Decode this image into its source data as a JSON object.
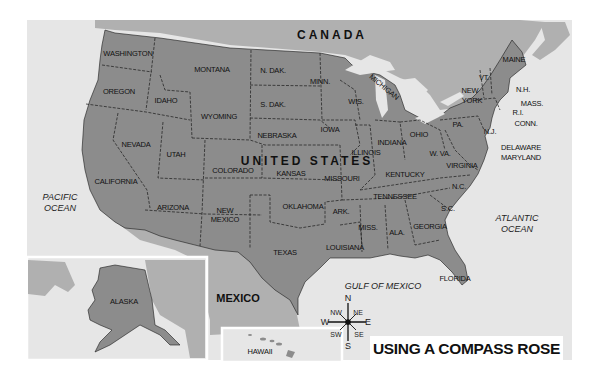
{
  "title": "USING A COMPASS ROSE",
  "countries": [
    {
      "name": "CANADA",
      "x": 332,
      "y": 35,
      "size": 12,
      "spacing": 3
    },
    {
      "name": "UNITED STATES",
      "x": 307,
      "y": 161,
      "size": 12,
      "spacing": 3
    },
    {
      "name": "MEXICO",
      "x": 238,
      "y": 298,
      "size": 11,
      "spacing": 0
    }
  ],
  "oceans": [
    {
      "name": "PACIFIC",
      "name2": "OCEAN",
      "x": 60,
      "y": 203
    },
    {
      "name": "ATLANTIC",
      "name2": "OCEAN",
      "x": 517,
      "y": 224
    },
    {
      "name": "GULF OF MEXICO",
      "name2": "",
      "x": 383,
      "y": 286
    }
  ],
  "states": [
    {
      "name": "WASHINGTON",
      "x": 128,
      "y": 53
    },
    {
      "name": "OREGON",
      "x": 119,
      "y": 91
    },
    {
      "name": "IDAHO",
      "x": 166,
      "y": 100
    },
    {
      "name": "MONTANA",
      "x": 212,
      "y": 69
    },
    {
      "name": "WYOMING",
      "x": 219,
      "y": 116
    },
    {
      "name": "N. DAK.",
      "x": 273,
      "y": 70
    },
    {
      "name": "S. DAK.",
      "x": 273,
      "y": 104
    },
    {
      "name": "NEBRASKA",
      "x": 277,
      "y": 135
    },
    {
      "name": "NEVADA",
      "x": 136,
      "y": 144
    },
    {
      "name": "UTAH",
      "x": 176,
      "y": 154
    },
    {
      "name": "COLORADO",
      "x": 233,
      "y": 170
    },
    {
      "name": "KANSAS",
      "x": 291,
      "y": 173
    },
    {
      "name": "CALIFORNIA",
      "x": 116,
      "y": 181
    },
    {
      "name": "ARIZONA",
      "x": 173,
      "y": 207
    },
    {
      "name": "NEW",
      "x": 225,
      "y": 210
    },
    {
      "name": "MEXICO",
      "x": 225,
      "y": 219
    },
    {
      "name": "OKLAHOMA",
      "x": 303,
      "y": 206
    },
    {
      "name": "TEXAS",
      "x": 285,
      "y": 252
    },
    {
      "name": "MINN.",
      "x": 320,
      "y": 81
    },
    {
      "name": "WIS.",
      "x": 356,
      "y": 101
    },
    {
      "name": "MICHIGAN",
      "x": 384,
      "y": 87,
      "rotate": 40
    },
    {
      "name": "IOWA",
      "x": 330,
      "y": 129
    },
    {
      "name": "ILLINOIS",
      "x": 366,
      "y": 152
    },
    {
      "name": "INDIANA",
      "x": 392,
      "y": 142
    },
    {
      "name": "OHIO",
      "x": 419,
      "y": 134
    },
    {
      "name": "MISSOURI",
      "x": 342,
      "y": 178
    },
    {
      "name": "KENTUCKY",
      "x": 405,
      "y": 174
    },
    {
      "name": "W. VA.",
      "x": 440,
      "y": 153
    },
    {
      "name": "VIRGINIA",
      "x": 462,
      "y": 165
    },
    {
      "name": "TENNESSEE",
      "x": 395,
      "y": 196
    },
    {
      "name": "N.C.",
      "x": 459,
      "y": 186
    },
    {
      "name": "S.C.",
      "x": 448,
      "y": 208
    },
    {
      "name": "ARK.",
      "x": 341,
      "y": 211
    },
    {
      "name": "MISS.",
      "x": 368,
      "y": 227
    },
    {
      "name": "ALA.",
      "x": 397,
      "y": 232
    },
    {
      "name": "GEORGIA",
      "x": 430,
      "y": 226
    },
    {
      "name": "LOUISIANA",
      "x": 345,
      "y": 247
    },
    {
      "name": "FLORIDA",
      "x": 455,
      "y": 278
    },
    {
      "name": "PA.",
      "x": 458,
      "y": 124
    },
    {
      "name": "NEW",
      "x": 470,
      "y": 90
    },
    {
      "name": "YORK",
      "x": 472,
      "y": 100
    },
    {
      "name": "VT.",
      "x": 484,
      "y": 77
    },
    {
      "name": "MAINE",
      "x": 514,
      "y": 59
    },
    {
      "name": "N.H.",
      "x": 523,
      "y": 89
    },
    {
      "name": "MASS.",
      "x": 532,
      "y": 103
    },
    {
      "name": "R.I.",
      "x": 518,
      "y": 112
    },
    {
      "name": "CONN.",
      "x": 526,
      "y": 123
    },
    {
      "name": "N.J.",
      "x": 490,
      "y": 131
    },
    {
      "name": "DELAWARE",
      "x": 521,
      "y": 147
    },
    {
      "name": "MARYLAND",
      "x": 521,
      "y": 157
    },
    {
      "name": "ALASKA",
      "x": 124,
      "y": 301
    },
    {
      "name": "HAWAII",
      "x": 260,
      "y": 351
    }
  ],
  "compass": {
    "center_x": 348,
    "center_y": 322,
    "N": "N",
    "S": "S",
    "E": "E",
    "W": "W",
    "NE": "NE",
    "NW": "NW",
    "SE": "SE",
    "SW": "SW"
  },
  "colors": {
    "land_us": "#8c8c8c",
    "land_other": "#b0b0b0",
    "water": "#e6e6e6",
    "inset_border": "#ffffff",
    "border": "#1a1a1a"
  }
}
